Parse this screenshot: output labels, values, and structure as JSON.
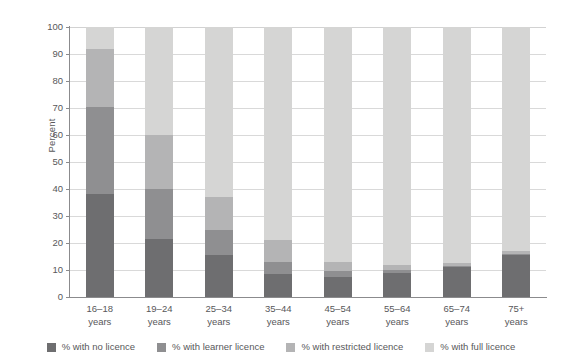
{
  "chart_data": {
    "type": "bar",
    "subtype": "stacked-100-percent",
    "title": "",
    "xlabel": "",
    "ylabel": "Percent",
    "ylim": [
      0,
      100
    ],
    "yticks": [
      0,
      10,
      20,
      30,
      40,
      50,
      60,
      70,
      80,
      90,
      100
    ],
    "ytick_labels": [
      "0",
      "10",
      "20",
      "30",
      "40",
      "50",
      "60",
      "70",
      "80",
      "90",
      "100"
    ],
    "grid": true,
    "grid_axis": "y",
    "legend_position": "bottom",
    "categories": [
      "16–18 years",
      "19–24 years",
      "25–34 years",
      "35–44 years",
      "45–54 years",
      "55–64 years",
      "65–74 years",
      "75+ years"
    ],
    "category_lines": [
      [
        "16–18",
        "years"
      ],
      [
        "19–24",
        "years"
      ],
      [
        "25–34",
        "years"
      ],
      [
        "35–44",
        "years"
      ],
      [
        "45–54",
        "years"
      ],
      [
        "55–64",
        "years"
      ],
      [
        "65–74",
        "years"
      ],
      [
        "75+",
        "years"
      ]
    ],
    "series": [
      {
        "name": "% with no licence",
        "color": "#6e6e70",
        "values": [
          38,
          21.5,
          15.5,
          8.5,
          7.3,
          9,
          11,
          15.5
        ]
      },
      {
        "name": "% with learner licence",
        "color": "#8f8f91",
        "values": [
          32.5,
          18.5,
          9.5,
          4.5,
          2.2,
          1,
          0.5,
          0.5
        ]
      },
      {
        "name": "% with restricted licence",
        "color": "#b4b4b5",
        "values": [
          21.5,
          20,
          12,
          8,
          3.5,
          2,
          1,
          1
        ]
      },
      {
        "name": "% with full licence",
        "color": "#d5d5d4",
        "values": [
          8,
          40,
          63,
          79,
          87,
          88,
          87.5,
          83
        ]
      }
    ]
  },
  "axis": {
    "y_title": "Percent"
  },
  "colors": {
    "no_licence": "#6e6e70",
    "learner_licence": "#8f8f91",
    "restricted_licence": "#b4b4b5",
    "full_licence": "#d5d5d4",
    "axis": "#8b8b8d",
    "gridline": "#d9d9d9",
    "text": "#58585a",
    "background": "#ffffff"
  }
}
